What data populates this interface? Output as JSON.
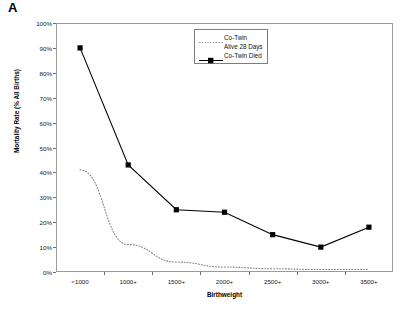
{
  "panel": {
    "label": "A"
  },
  "chart_data": {
    "type": "line",
    "title": "",
    "xlabel": "Birthweight",
    "ylabel": "Mortality Rate (% All Births)",
    "categories": [
      "<1000",
      "1000+",
      "1500+",
      "2000+",
      "2500+",
      "3000+",
      "3500+"
    ],
    "ylim": [
      0,
      100
    ],
    "ytick_labels": [
      "0%",
      "10%",
      "20%",
      "30%",
      "40%",
      "50%",
      "60%",
      "70%",
      "80%",
      "90%",
      "100%"
    ],
    "ytick_values": [
      0,
      10,
      20,
      30,
      40,
      50,
      60,
      70,
      80,
      90,
      100
    ],
    "grid": false,
    "legend_position": "top-right",
    "series": [
      {
        "name": "Co-Twin Alive 28 Days",
        "legend_line1": "Co-Twin",
        "legend_line2": "Alive 28 Days",
        "style": "dotted",
        "marker": "none",
        "color": "#808080",
        "values": [
          41,
          11,
          4,
          2,
          1.3,
          1,
          1
        ]
      },
      {
        "name": "Co-Twin Died",
        "legend_line1": "Co-Twin Died",
        "legend_line2": "",
        "style": "solid",
        "marker": "square",
        "color": "#000000",
        "values": [
          90,
          43,
          25,
          24,
          15,
          10,
          18
        ]
      }
    ]
  }
}
